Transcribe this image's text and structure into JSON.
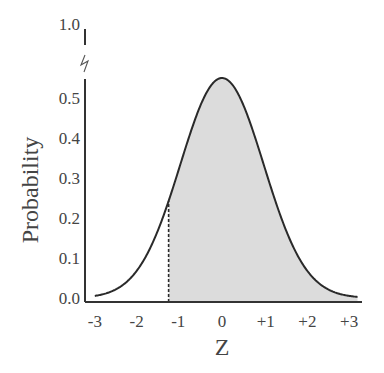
{
  "chart_data": {
    "type": "area",
    "title": "",
    "xlabel": "Z",
    "ylabel": "Probability",
    "x_ticks": [
      "-3",
      "-2",
      "-1",
      "0",
      "+1",
      "+2",
      "+3"
    ],
    "x_tick_values": [
      -3,
      -2,
      -1,
      0,
      1,
      2,
      3
    ],
    "y_ticks": [
      "0.0",
      "0.1",
      "0.2",
      "0.3",
      "0.4",
      "0.5",
      "1.0"
    ],
    "y_tick_values": [
      0.0,
      0.1,
      0.2,
      0.3,
      0.4,
      0.5,
      1.0
    ],
    "axis_break": {
      "between": [
        0.5,
        1.0
      ]
    },
    "xlim": [
      -3.3,
      3.3
    ],
    "ylim": [
      0,
      0.55
    ],
    "curve": "normal bell curve centered at 0",
    "peak": {
      "x": 0,
      "y": 0.55
    },
    "shaded_region": {
      "from": -1.28,
      "to": 3.3,
      "color": "#d9d9d9"
    },
    "dashed_line": {
      "x": -1.28,
      "y_top": 0.26
    },
    "grid": false,
    "legend": null
  }
}
